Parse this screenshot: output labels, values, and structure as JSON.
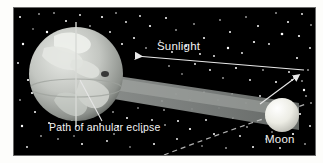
{
  "figure": {
    "background_color": "#000000",
    "border_color": "#6a6a6a",
    "page_color": "#fdfdfb",
    "labels": {
      "sunlight": "Sunlight",
      "path_of_annular_eclipse": "Path of annular eclipse",
      "moon": "Moon"
    },
    "objects": {
      "earth": {
        "name": "Earth",
        "cx": 62,
        "cy": 66,
        "r": 47,
        "body_color": "#b9bcb8",
        "land_color": "#e8eae6",
        "axis_color": "#d8dad6",
        "eclipse_spot_color": "#2b2b2b"
      },
      "moon": {
        "name": "Moon",
        "cx": 268,
        "cy": 107,
        "r": 17,
        "body_color": "#f0f0ea"
      },
      "shadow_cone": {
        "name": "Umbra / antumbra shadow cone",
        "color": "#8e9290"
      },
      "orbit_arc": {
        "name": "Lunar orbit",
        "color": "#cfcfcf",
        "dashed": true
      },
      "sunlight_ray": {
        "name": "Sunlight ray arrow",
        "color": "#e8e8e8",
        "direction": "right-to-left"
      }
    },
    "starfield": {
      "star_color": "#ffffff",
      "count": 150
    }
  }
}
